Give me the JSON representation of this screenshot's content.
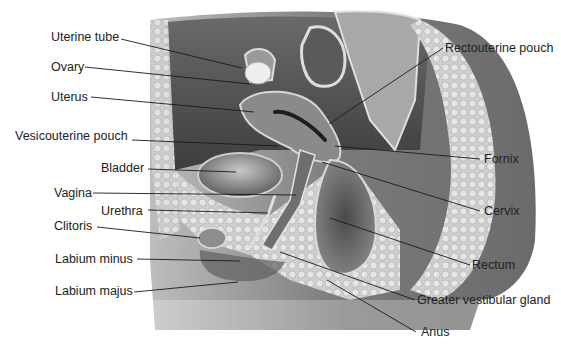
{
  "labels": {
    "uterine_tube": "Uterine tube",
    "ovary": "Ovary",
    "uterus": "Uterus",
    "vesicouterine_pouch": "Vesicouterine pouch",
    "bladder": "Bladder",
    "vagina": "Vagina",
    "urethra": "Urethra",
    "clitoris": "Clitoris",
    "labium_minus": "Labium minus",
    "labium_majus": "Labium majus",
    "rectouterine_pouch": "Rectouterine pouch",
    "fornix": "Fornix",
    "cervix": "Cervix",
    "rectum": "Rectum",
    "greater_vestibular_gland": "Greater vestibular gland",
    "anus": "Anus"
  },
  "colors": {
    "background": "#ffffff",
    "text": "#222222",
    "leader": "#1a1a1a",
    "tissue_dark": "#5a5a5a",
    "tissue_mid": "#8c8c8c",
    "tissue_light": "#c8c8c8",
    "fat": "#d9d9d9"
  }
}
